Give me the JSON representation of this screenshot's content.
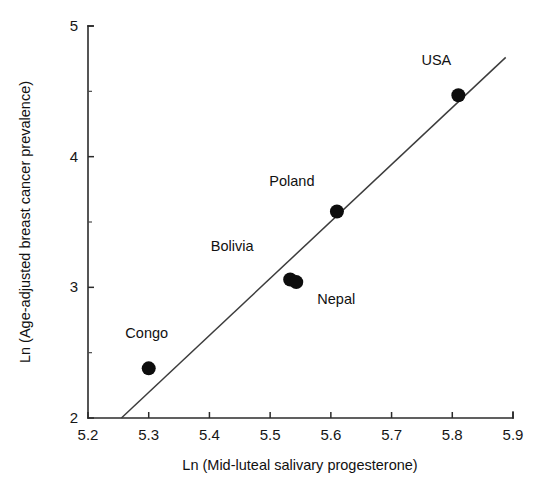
{
  "chart_data": {
    "type": "scatter",
    "title": "",
    "xlabel": "Ln (Mid-luteal salivary progesterone)",
    "ylabel": "Ln (Age-adjusted breast cancer prevalence)",
    "xlim": [
      5.2,
      5.9
    ],
    "ylim": [
      2,
      5
    ],
    "grid": false,
    "legend": "none",
    "x_ticks": [
      5.2,
      5.3,
      5.4,
      5.5,
      5.6,
      5.7,
      5.8,
      5.9
    ],
    "x_tick_labels": [
      "5.2",
      "5.3",
      "5.4",
      "5.5",
      "5.6",
      "5.7",
      "5.8",
      "5.9"
    ],
    "y_ticks": [
      2,
      3,
      4,
      5
    ],
    "y_tick_labels": [
      "2",
      "3",
      "4",
      "5"
    ],
    "y_minor_ticks": [
      2.5,
      3.5,
      4.5
    ],
    "points": [
      {
        "label": "Congo",
        "x": 5.3,
        "y": 2.38,
        "label_dx": -2,
        "label_dy": -30
      },
      {
        "label": "Bolivia",
        "x": 5.533,
        "y": 3.06,
        "label_dx": -58,
        "label_dy": -28
      },
      {
        "label": "Nepal",
        "x": 5.543,
        "y": 3.04,
        "label_dx": 40,
        "label_dy": 22
      },
      {
        "label": "Poland",
        "x": 5.61,
        "y": 3.58,
        "label_dx": -45,
        "label_dy": -26
      },
      {
        "label": "USA",
        "x": 5.81,
        "y": 4.47,
        "label_dx": -22,
        "label_dy": -30
      }
    ],
    "fit_line": {
      "name": "regression-line",
      "x_start": 5.255,
      "y_start": 2.0,
      "x_end": 5.888,
      "y_end": 4.76
    },
    "marker_radius_px": 7,
    "series_color": "#0d0d0d",
    "axis_color": "#2b2b2b"
  }
}
